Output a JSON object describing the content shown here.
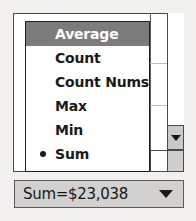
{
  "widget": {
    "name": "summary-function-dropdown"
  },
  "menu": {
    "items": [
      {
        "label": "Average",
        "selected": true,
        "checked": false
      },
      {
        "label": "Count",
        "selected": false,
        "checked": false
      },
      {
        "label": "Count Nums",
        "selected": false,
        "checked": false
      },
      {
        "label": "Max",
        "selected": false,
        "checked": false
      },
      {
        "label": "Min",
        "selected": false,
        "checked": false
      },
      {
        "label": "Sum",
        "selected": false,
        "checked": true
      }
    ]
  },
  "status_bar": {
    "value": "Sum=$23,038",
    "dropdown_icon": "triangle-down-icon"
  },
  "scrollbar": {
    "down_button_icon": "triangle-down-icon"
  },
  "colors": {
    "highlight": "#7c7c7c",
    "highlight_text": "#ffffff",
    "menu_bg": "#ffffff",
    "combo_bg": "#d2d1cf",
    "border": "#1f1f1f",
    "page_bg": "#f1f0ee"
  }
}
